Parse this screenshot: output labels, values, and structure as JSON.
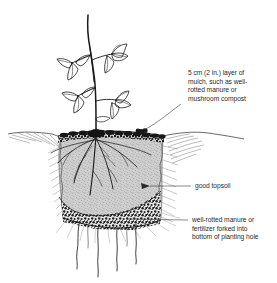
{
  "figure": {
    "background_color": "#ffffff",
    "ink_color": "#1a1a1a",
    "text_color": "#2b2b2b",
    "topsoil_fill": "#b9b9b9",
    "mulch_fill": "#222222",
    "manure_fill": "#2a2a2a"
  },
  "callouts": {
    "mulch": {
      "name": "mulch-layer-label",
      "lines": [
        "5 cm (2 in.) layer of",
        "mulch, such as well-",
        "rotted manure or",
        "mushroom compost"
      ]
    },
    "topsoil": {
      "name": "topsoil-label",
      "lines": [
        "good topsoil"
      ]
    },
    "manure": {
      "name": "manure-layer-label",
      "lines": [
        "well-rotted manure or",
        "fertilizer forked into",
        "bottom of planting hole"
      ]
    }
  },
  "illustration_parts": {
    "plant": "young shrub with slender stem and compound three-leaflet leaves",
    "ground_line": "soil surface extending left and right of planting hole",
    "mulch_band": "dark stippled band at soil surface",
    "topsoil_mass": "light grey stippled backfill containing the root system",
    "manure_band": "coarse dark stippled layer at the base of the hole",
    "roots_upper": "fibrous roots spreading through the topsoil",
    "roots_lower": "four wavy roots extending below the planting hole"
  }
}
